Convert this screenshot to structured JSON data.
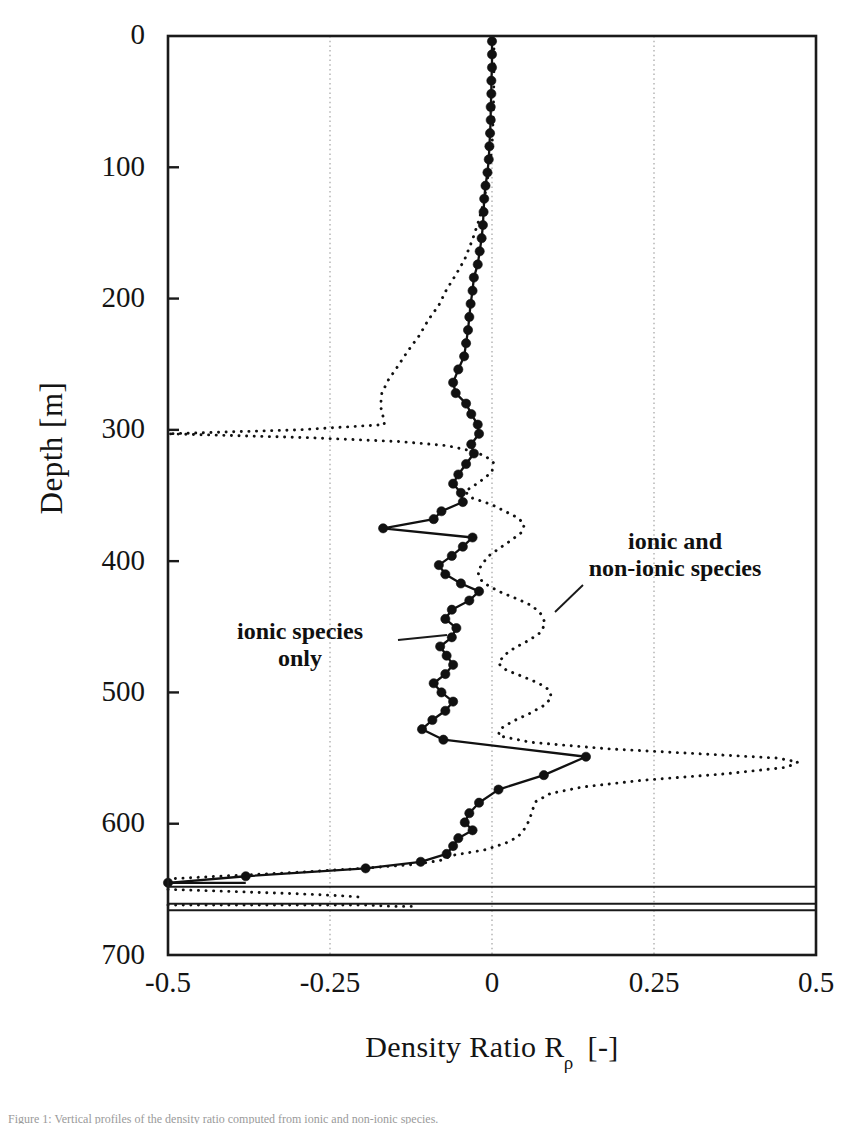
{
  "figure": {
    "title": "",
    "caption_stub": "Figure 1: Vertical profiles of the density ratio computed from ionic and non-ionic species."
  },
  "axes": {
    "x": {
      "label_main": "Density Ratio  R",
      "label_sub": "ρ",
      "label_unit": "[-]",
      "ticks": [
        "-0.5",
        "-0.25",
        "0",
        "0.25",
        "0.5"
      ],
      "tick_values": [
        -0.5,
        -0.25,
        0,
        0.25,
        0.5
      ],
      "min": -0.5,
      "max": 0.5,
      "gridlines": [
        -0.25,
        0,
        0.25
      ]
    },
    "y": {
      "label": "Depth  [m]",
      "ticks": [
        "0",
        "100",
        "200",
        "300",
        "400",
        "500",
        "600",
        "700"
      ],
      "tick_values": [
        0,
        100,
        200,
        300,
        400,
        500,
        600,
        700
      ],
      "min": 0,
      "max": 700,
      "inverted": true
    }
  },
  "annotations": [
    {
      "name": "ionic-species-only",
      "lines": [
        "ionic species",
        "only"
      ],
      "x_px": 300,
      "y_px": 632,
      "leader": {
        "x1": 398,
        "y1": 640,
        "x2": 447,
        "y2": 635
      }
    },
    {
      "name": "ionic-and-non-ionic-species",
      "lines": [
        "ionic and",
        "non-ionic species"
      ],
      "x_px": 650,
      "y_px": 548,
      "leader": {
        "x1": 555,
        "y1": 612,
        "x2": 583,
        "y2": 585
      }
    }
  ],
  "colors": {
    "axis": "#1a1a1a",
    "grid": "#9a9a9a",
    "ionic": "#111111",
    "ionic_nonionic": "#111111",
    "background": "#ffffff"
  },
  "chart_data": {
    "type": "line",
    "title": "",
    "xlabel": "Density Ratio Rρ [-]",
    "ylabel": "Depth [m]",
    "xlim": [
      -0.5,
      0.5
    ],
    "ylim": [
      700,
      0
    ],
    "y_inverted": true,
    "grid": true,
    "grid_x": [
      -0.25,
      0,
      0.25
    ],
    "legend": "inline-annotations",
    "series": [
      {
        "name": "ionic species only",
        "style": "solid-with-filled-circle-markers",
        "marker": "filled-circle",
        "points": [
          [
            0.0,
            4
          ],
          [
            0.0,
            14
          ],
          [
            0.0,
            24
          ],
          [
            -0.001,
            34
          ],
          [
            -0.001,
            44
          ],
          [
            -0.002,
            54
          ],
          [
            -0.002,
            64
          ],
          [
            -0.003,
            74
          ],
          [
            -0.004,
            84
          ],
          [
            -0.005,
            94
          ],
          [
            -0.007,
            104
          ],
          [
            -0.01,
            114
          ],
          [
            -0.012,
            124
          ],
          [
            -0.013,
            134
          ],
          [
            -0.014,
            144
          ],
          [
            -0.016,
            154
          ],
          [
            -0.019,
            164
          ],
          [
            -0.022,
            174
          ],
          [
            -0.028,
            184
          ],
          [
            -0.03,
            194
          ],
          [
            -0.033,
            204
          ],
          [
            -0.035,
            214
          ],
          [
            -0.037,
            224
          ],
          [
            -0.04,
            234
          ],
          [
            -0.043,
            244
          ],
          [
            -0.052,
            254
          ],
          [
            -0.06,
            264
          ],
          [
            -0.056,
            272
          ],
          [
            -0.04,
            280
          ],
          [
            -0.032,
            288
          ],
          [
            -0.022,
            296
          ],
          [
            -0.02,
            303
          ],
          [
            -0.032,
            311
          ],
          [
            -0.028,
            318
          ],
          [
            -0.04,
            326
          ],
          [
            -0.052,
            334
          ],
          [
            -0.06,
            341
          ],
          [
            -0.048,
            348
          ],
          [
            -0.045,
            355
          ],
          [
            -0.078,
            362
          ],
          [
            -0.09,
            368
          ],
          [
            -0.168,
            375
          ],
          [
            -0.03,
            382
          ],
          [
            -0.045,
            389
          ],
          [
            -0.062,
            396
          ],
          [
            -0.082,
            403
          ],
          [
            -0.072,
            410
          ],
          [
            -0.048,
            417
          ],
          [
            -0.02,
            423
          ],
          [
            -0.035,
            430
          ],
          [
            -0.062,
            437
          ],
          [
            -0.072,
            444
          ],
          [
            -0.055,
            451
          ],
          [
            -0.062,
            458
          ],
          [
            -0.08,
            465
          ],
          [
            -0.07,
            472
          ],
          [
            -0.06,
            479
          ],
          [
            -0.072,
            486
          ],
          [
            -0.09,
            493
          ],
          [
            -0.078,
            500
          ],
          [
            -0.06,
            507
          ],
          [
            -0.072,
            514
          ],
          [
            -0.092,
            521
          ],
          [
            -0.108,
            528
          ],
          [
            -0.075,
            536
          ],
          [
            0.145,
            549
          ],
          [
            0.08,
            563
          ],
          [
            0.01,
            574
          ],
          [
            -0.02,
            584
          ],
          [
            -0.035,
            592
          ],
          [
            -0.042,
            599
          ],
          [
            -0.03,
            605
          ],
          [
            -0.052,
            611
          ],
          [
            -0.06,
            617
          ],
          [
            -0.07,
            623
          ],
          [
            -0.11,
            629
          ],
          [
            -0.195,
            634
          ],
          [
            -0.38,
            640
          ],
          [
            -0.5,
            645
          ]
        ]
      },
      {
        "name": "ionic and non-ionic species",
        "style": "dotted",
        "marker": "none",
        "points": [
          [
            0.003,
            4
          ],
          [
            0.003,
            30
          ],
          [
            0.002,
            60
          ],
          [
            0.0,
            85
          ],
          [
            -0.004,
            100
          ],
          [
            -0.008,
            112
          ],
          [
            -0.012,
            125
          ],
          [
            -0.02,
            140
          ],
          [
            -0.03,
            155
          ],
          [
            -0.042,
            170
          ],
          [
            -0.056,
            182
          ],
          [
            -0.07,
            193
          ],
          [
            -0.082,
            205
          ],
          [
            -0.098,
            216
          ],
          [
            -0.112,
            228
          ],
          [
            -0.13,
            240
          ],
          [
            -0.146,
            252
          ],
          [
            -0.16,
            262
          ],
          [
            -0.17,
            272
          ],
          [
            -0.172,
            282
          ],
          [
            -0.168,
            290
          ],
          [
            -0.166,
            296
          ],
          [
            -0.3,
            300
          ],
          [
            -0.5,
            303
          ],
          [
            -0.28,
            306
          ],
          [
            -0.14,
            309
          ],
          [
            -0.07,
            312
          ],
          [
            -0.032,
            316
          ],
          [
            -0.01,
            320
          ],
          [
            0.002,
            325
          ],
          [
            0.0,
            332
          ],
          [
            -0.02,
            340
          ],
          [
            -0.042,
            347
          ],
          [
            -0.03,
            352
          ],
          [
            0.0,
            357
          ],
          [
            0.02,
            362
          ],
          [
            0.04,
            367
          ],
          [
            0.05,
            372
          ],
          [
            0.046,
            378
          ],
          [
            0.03,
            384
          ],
          [
            0.012,
            390
          ],
          [
            -0.005,
            396
          ],
          [
            -0.015,
            402
          ],
          [
            -0.022,
            408
          ],
          [
            -0.018,
            414
          ],
          [
            -0.005,
            419
          ],
          [
            0.015,
            424
          ],
          [
            0.04,
            429
          ],
          [
            0.062,
            434
          ],
          [
            0.075,
            440
          ],
          [
            0.082,
            447
          ],
          [
            0.076,
            454
          ],
          [
            0.058,
            460
          ],
          [
            0.035,
            466
          ],
          [
            0.018,
            472
          ],
          [
            0.01,
            478
          ],
          [
            0.022,
            483
          ],
          [
            0.048,
            488
          ],
          [
            0.072,
            493
          ],
          [
            0.088,
            498
          ],
          [
            0.092,
            504
          ],
          [
            0.08,
            510
          ],
          [
            0.058,
            516
          ],
          [
            0.032,
            522
          ],
          [
            0.012,
            528
          ],
          [
            0.01,
            533
          ],
          [
            0.06,
            538
          ],
          [
            0.18,
            543
          ],
          [
            0.33,
            547
          ],
          [
            0.44,
            550
          ],
          [
            0.472,
            553
          ],
          [
            0.455,
            557
          ],
          [
            0.36,
            562
          ],
          [
            0.23,
            567
          ],
          [
            0.14,
            572
          ],
          [
            0.09,
            577
          ],
          [
            0.068,
            583
          ],
          [
            0.062,
            590
          ],
          [
            0.058,
            597
          ],
          [
            0.05,
            604
          ],
          [
            0.04,
            610
          ],
          [
            0.02,
            615
          ],
          [
            -0.012,
            620
          ],
          [
            -0.06,
            624
          ],
          [
            -0.08,
            628
          ],
          [
            -0.12,
            631
          ],
          [
            -0.2,
            634
          ],
          [
            -0.3,
            637
          ],
          [
            -0.42,
            640
          ],
          [
            -0.5,
            642
          ]
        ]
      },
      {
        "name": "ionic and non-ionic species lower tail",
        "style": "dotted",
        "marker": "none",
        "points": [
          [
            -0.5,
            650
          ],
          [
            -0.44,
            651
          ],
          [
            -0.38,
            652
          ],
          [
            -0.32,
            653
          ],
          [
            -0.27,
            654
          ],
          [
            -0.23,
            655
          ],
          [
            -0.2,
            656
          ]
        ]
      },
      {
        "name": "ionic and non-ionic species bottom tail",
        "style": "dotted",
        "marker": "none",
        "points": [
          [
            -0.5,
            662
          ],
          [
            -0.42,
            662
          ],
          [
            -0.34,
            662
          ],
          [
            -0.26,
            662
          ],
          [
            -0.19,
            662
          ],
          [
            -0.15,
            663
          ],
          [
            -0.12,
            663
          ]
        ]
      }
    ],
    "horizontal_lines": [
      {
        "name": "interface-upper",
        "depth": 648,
        "x_from": -0.5,
        "x_to": 0.5
      },
      {
        "name": "interface-lower",
        "depth": 661,
        "x_from": -0.5,
        "x_to": 0.5
      },
      {
        "name": "interface-bottom",
        "depth": 666,
        "x_from": -0.5,
        "x_to": 0.5
      }
    ],
    "ionic_bottom_segment": {
      "name": "ionic-bottom-flat",
      "depth": 645,
      "x_from": -0.5,
      "x_to": -0.38
    }
  }
}
